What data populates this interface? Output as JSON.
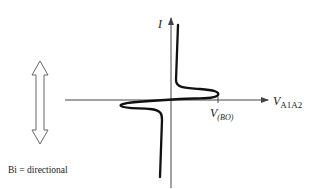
{
  "diagram": {
    "y_axis_label": "I",
    "x_axis_label_main": "V",
    "x_axis_label_sub": "A1A2",
    "breakover_label_main": "V",
    "breakover_label_sub": "(BO)",
    "caption": "Bi = directional",
    "symbols": {
      "double_arrow": "bidirectional-arrow-icon"
    },
    "colors": {
      "curve": "#111111",
      "axis": "#444444",
      "arrow_outline": "#666666",
      "background": "#ffffff"
    }
  }
}
